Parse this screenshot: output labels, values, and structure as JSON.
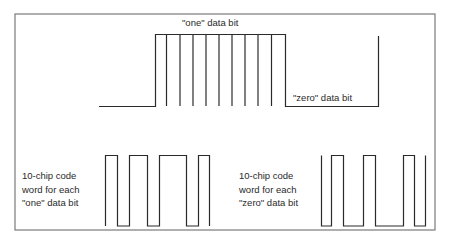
{
  "diagram": {
    "title_labels": {
      "one_bit": "\"one\" data bit",
      "zero_bit": "\"zero\" data bit"
    },
    "code_word_labels": {
      "one": [
        "10-chip code",
        "word for each",
        "\"one\" data bit"
      ],
      "zero": [
        "10-chip code",
        "word for each",
        "\"zero\" data bit"
      ]
    },
    "colors": {
      "line": "#2a2a2a",
      "frame": "#7a7a7a",
      "background": "#ffffff"
    },
    "data_waveform": {
      "description": "Data signal: low, then 'one' bit high with 10 chip ticks, then 'zero' bit low, then rising edge",
      "chips_per_bit": 10
    },
    "one_code_word": {
      "chips": [
        1,
        0,
        1,
        1,
        0,
        1,
        1,
        0,
        1,
        0
      ]
    },
    "zero_code_word": {
      "chips": [
        0,
        1,
        0,
        0,
        1,
        0,
        0,
        1,
        0,
        1
      ]
    }
  }
}
